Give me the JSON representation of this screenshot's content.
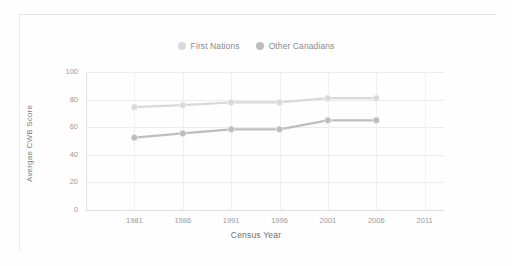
{
  "figure": {
    "background": "#fefefe",
    "frame_color": "#e6e6e6"
  },
  "legend": {
    "position": "top-center",
    "items": [
      {
        "label": "First Nations",
        "color": "#d9d9d9",
        "swatch": "circle-marker"
      },
      {
        "label": "Other Canadians",
        "color": "#bdbdbd",
        "swatch": "circle-marker"
      }
    ]
  },
  "axes": {
    "y_title": "Avergae CWB Score",
    "x_title": "Census Year",
    "y_ticks": [
      "0",
      "20",
      "40",
      "60",
      "80",
      "100"
    ],
    "x_ticks": [
      "1981",
      "1986",
      "1991",
      "1996",
      "2001",
      "2006",
      "2011"
    ]
  },
  "chart_data": {
    "type": "line",
    "title": "",
    "subtitle": "",
    "xlabel": "Census Year",
    "ylabel": "Avergae CWB Score",
    "categories": [
      "1981",
      "1986",
      "1991",
      "1996",
      "2001",
      "2006",
      "2011"
    ],
    "x": [
      1981,
      1986,
      1991,
      1996,
      2001,
      2006,
      2011
    ],
    "xlim": [
      1976,
      2013
    ],
    "ylim": [
      0,
      100
    ],
    "ytick_values": [
      0,
      20,
      40,
      60,
      80,
      100
    ],
    "grid": "horizontal-and-vertical",
    "legend_position": "top-center",
    "markers": "circle",
    "series": [
      {
        "name": "Other Canadians",
        "color": "#d9d9d9",
        "values": [
          74.5,
          76.0,
          78.0,
          78.0,
          81.0,
          81.0,
          null
        ]
      },
      {
        "name": "First Nations",
        "color": "#bdbdbd",
        "values": [
          52.5,
          55.5,
          58.5,
          58.5,
          65.0,
          65.0,
          null
        ]
      }
    ],
    "annotations": []
  }
}
